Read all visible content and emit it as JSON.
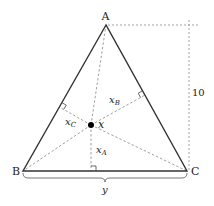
{
  "diagram": {
    "type": "geometry",
    "vertices": {
      "A": {
        "label": "A",
        "x": 106,
        "y": 25
      },
      "B": {
        "label": "B",
        "x": 23,
        "y": 171
      },
      "C": {
        "label": "C",
        "x": 187,
        "y": 171
      }
    },
    "point": {
      "label": "x",
      "x": 91,
      "y": 125
    },
    "distances": {
      "to_BC": {
        "label": "x",
        "sub": "A"
      },
      "to_AC": {
        "label": "x",
        "sub": "B"
      },
      "to_AB": {
        "label": "x",
        "sub": "C"
      }
    },
    "height_label": "10",
    "base_label": "y",
    "colors": {
      "stroke": "#333333",
      "dashed": "#888888",
      "point": "#000000"
    }
  }
}
